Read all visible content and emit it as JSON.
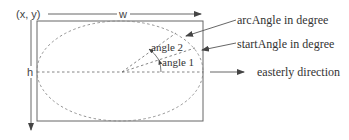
{
  "labels": {
    "origin": "(x, y)",
    "width": "w",
    "height": "h",
    "angle1": "angle 1",
    "angle2": "angle 2",
    "arc_angle": "arcAngle in degree",
    "start_angle": "startAngle in degree",
    "easterly": "easterly direction"
  },
  "colors": {
    "stroke": "#555555",
    "dashed": "#777777",
    "text": "#333333",
    "background": "#ffffff"
  }
}
